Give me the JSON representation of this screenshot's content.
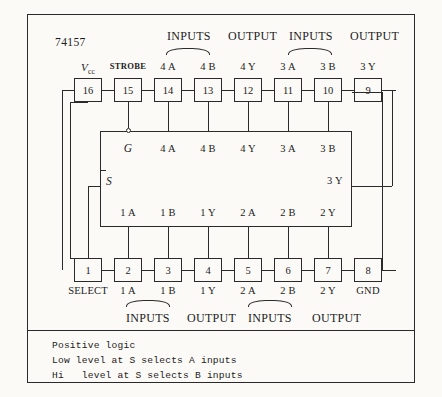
{
  "diagram": {
    "part_number": "74157",
    "top_headers": [
      {
        "text": "INPUTS",
        "left": 167,
        "top": 30
      },
      {
        "text": "OUTPUT",
        "left": 228,
        "top": 30
      },
      {
        "text": "INPUTS",
        "left": 289,
        "top": 30
      },
      {
        "text": "OUTPUT",
        "left": 350,
        "top": 30
      }
    ],
    "bottom_headers": [
      {
        "text": "INPUTS",
        "left": 126,
        "top": 312
      },
      {
        "text": "OUTPUT",
        "left": 187,
        "top": 312
      },
      {
        "text": "INPUTS",
        "left": 248,
        "top": 312
      },
      {
        "text": "OUTPUT",
        "left": 312,
        "top": 312
      }
    ],
    "top_braces": [
      {
        "left": 166,
        "top": 48,
        "width": 44
      },
      {
        "left": 288,
        "top": 48,
        "width": 44
      }
    ],
    "bottom_braces": [
      {
        "left": 126,
        "top": 300,
        "width": 44
      },
      {
        "left": 248,
        "top": 300,
        "width": 44
      }
    ],
    "top_pins": [
      {
        "number": "16",
        "label": "Vcc",
        "label_type": "vcc",
        "x": 88
      },
      {
        "number": "15",
        "label": "STROBE",
        "label_type": "strobe",
        "x": 128
      },
      {
        "number": "14",
        "label": "4 A",
        "label_type": "plain",
        "x": 168
      },
      {
        "number": "13",
        "label": "4 B",
        "label_type": "plain",
        "x": 208
      },
      {
        "number": "12",
        "label": "4 Y",
        "label_type": "plain",
        "x": 248
      },
      {
        "number": "11",
        "label": "3 A",
        "label_type": "plain",
        "x": 288
      },
      {
        "number": "10",
        "label": "3 B",
        "label_type": "plain",
        "x": 328
      },
      {
        "number": "9",
        "label": "3 Y",
        "label_type": "plain",
        "x": 368
      }
    ],
    "bottom_pins": [
      {
        "number": "1",
        "label": "SELECT",
        "x": 88
      },
      {
        "number": "2",
        "label": "1 A",
        "x": 128
      },
      {
        "number": "3",
        "label": "1 B",
        "x": 168
      },
      {
        "number": "4",
        "label": "1 Y",
        "x": 208
      },
      {
        "number": "5",
        "label": "2 A",
        "x": 248
      },
      {
        "number": "6",
        "label": "2 B",
        "x": 288
      },
      {
        "number": "7",
        "label": "2 Y",
        "x": 328
      },
      {
        "number": "8",
        "label": "GND",
        "x": 368
      }
    ],
    "inner_top_labels": [
      {
        "text": "G",
        "style": "ital",
        "x": 128,
        "y": 143
      },
      {
        "text": "4 A",
        "style": "plain",
        "x": 168,
        "y": 144
      },
      {
        "text": "4 B",
        "style": "plain",
        "x": 208,
        "y": 144
      },
      {
        "text": "4 Y",
        "style": "plain",
        "x": 248,
        "y": 144
      },
      {
        "text": "3 A",
        "style": "plain",
        "x": 288,
        "y": 144
      },
      {
        "text": "3 B",
        "style": "plain",
        "x": 328,
        "y": 144
      }
    ],
    "inner_bottom_labels": [
      {
        "text": "1 A",
        "x": 128,
        "y": 208
      },
      {
        "text": "1 B",
        "x": 168,
        "y": 208
      },
      {
        "text": "1 Y",
        "x": 208,
        "y": 208
      },
      {
        "text": "2 A",
        "x": 248,
        "y": 208
      },
      {
        "text": "2 B",
        "x": 288,
        "y": 208
      },
      {
        "text": "2 Y",
        "x": 328,
        "y": 208
      }
    ],
    "inner_side_labels": [
      {
        "text": "S",
        "style": "ital",
        "x": 106,
        "y": 176
      },
      {
        "text": "3 Y",
        "style": "plain",
        "x": 327,
        "y": 176
      }
    ],
    "legend_lines": [
      "Positive logic",
      "Low level at S selects A inputs",
      "Hi   level at S selects B inputs"
    ]
  },
  "colors": {
    "ink": "#2a2a2a",
    "paper": "#fbfaf7"
  }
}
